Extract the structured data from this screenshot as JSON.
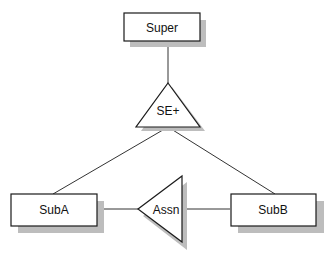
{
  "diagram": {
    "nodes": {
      "super": {
        "label": "Super",
        "shape": "rectangle"
      },
      "se_plus": {
        "label": "SE+",
        "shape": "triangle-up"
      },
      "sub_a": {
        "label": "SubA",
        "shape": "rectangle"
      },
      "sub_b": {
        "label": "SubB",
        "shape": "rectangle"
      },
      "assn": {
        "label": "Assn",
        "shape": "triangle-left"
      }
    },
    "edges": [
      {
        "from": "Super",
        "to": "SE+"
      },
      {
        "from": "SE+",
        "to": "SubA"
      },
      {
        "from": "SE+",
        "to": "SubB"
      },
      {
        "from": "SubA",
        "to": "Assn"
      },
      {
        "from": "Assn",
        "to": "SubB"
      }
    ],
    "colors": {
      "stroke": "#1a1a1a",
      "shadow": "#bdbdbd",
      "fill": "#ffffff"
    }
  }
}
